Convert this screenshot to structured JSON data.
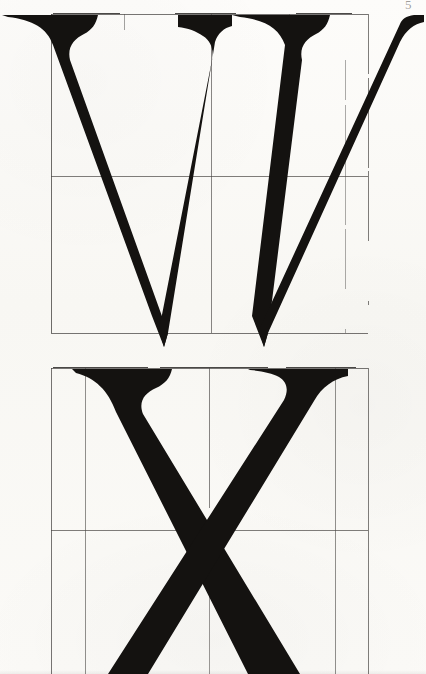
{
  "plate": {
    "kind": "letterform-construction-plate",
    "title": "Roman capital letterform construction plate",
    "page_mark": "5",
    "background_color": "#fbfaf7",
    "ink_color": "#141210",
    "grid_color": "#4a4745",
    "width": 426,
    "height": 674
  },
  "specimens": [
    {
      "id": "w",
      "letter": "W",
      "label": "Capital W",
      "style": "roman-serif-heavy",
      "cropped": false,
      "grid": {
        "box_left": 51,
        "box_right": 368,
        "box_top": 14,
        "box_bottom": 333,
        "center_x": 211,
        "midline_y": 176,
        "inner_verticals": [
          124,
          289
        ],
        "description": "Square construction box with vertical centre line, horizontal half-line and two inner verticals"
      },
      "glyph": {
        "top_serif_line_y": 15,
        "baseline_y": 333,
        "apex_points": [
          {
            "x": 164,
            "y": 347
          },
          {
            "x": 264,
            "y": 347
          }
        ],
        "middle_vertex_y": 188,
        "thick_stroke_angle_note": "two heavy left-leaning diagonals, two hairline right-leaning diagonals",
        "serif_extends_past_box": true
      }
    },
    {
      "id": "x",
      "letter": "X",
      "label": "Capital X",
      "style": "roman-serif-heavy",
      "cropped": true,
      "grid": {
        "box_left": 51,
        "box_right": 368,
        "box_top": 368,
        "box_bottom": 690,
        "center_x": 209,
        "midline_y": 530,
        "inner_verticals": [
          85,
          335
        ],
        "description": "Square construction box with vertical centre line, horizontal half-line and two inner verticals; lower portion runs off the page"
      },
      "glyph": {
        "top_serif_line_y": 369,
        "crossing_point": {
          "x": 208,
          "y": 530
        },
        "thick_stroke_angle_note": "heavy diagonal from upper-left to lower-right, hairline diagonal from upper-right to lower-left",
        "serif_extends_past_box": true,
        "bottom_cropped_at_y": 674
      }
    }
  ]
}
